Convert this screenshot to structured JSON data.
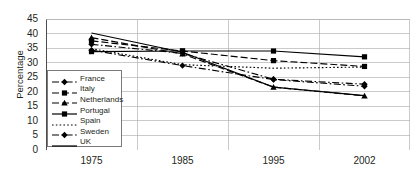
{
  "chart_data": {
    "type": "line",
    "title": "",
    "xlabel": "",
    "ylabel": "Percentage",
    "categories": [
      "1975",
      "1985",
      "1995",
      "2002"
    ],
    "x_tick_labels": [
      "1975",
      "1985",
      "1995",
      "2002"
    ],
    "y_tick_labels": [
      "0",
      "5",
      "10",
      "15",
      "20",
      "25",
      "30",
      "35",
      "40",
      "45"
    ],
    "ylim": [
      0,
      45
    ],
    "y_step": 5,
    "grid": "horizontal",
    "legend_position": "inside-lower-left",
    "series": [
      {
        "name": "France",
        "values": [
          36.3,
          33.2,
          24.3,
          22.6
        ],
        "marker": "diamond",
        "dash": "dash-dot",
        "color": "#000000"
      },
      {
        "name": "Italy",
        "values": [
          37.5,
          34.0,
          30.7,
          28.7
        ],
        "marker": "square",
        "dash": "dash",
        "color": "#000000"
      },
      {
        "name": "Netherlands",
        "values": [
          38.6,
          33.0,
          21.6,
          18.6
        ],
        "marker": "triangle",
        "dash": "dash",
        "color": "#000000"
      },
      {
        "name": "Portugal",
        "values": [
          33.8,
          34.0,
          34.0,
          32.0
        ],
        "marker": "square",
        "dash": "solid",
        "color": "#000000"
      },
      {
        "name": "Spain",
        "values": [
          34.8,
          29.3,
          28.1,
          28.5
        ],
        "marker": "none",
        "dash": "dotted",
        "color": "#000000"
      },
      {
        "name": "Sweden",
        "values": [
          34.3,
          29.0,
          24.2,
          21.9
        ],
        "marker": "diamond",
        "dash": "dash-dot",
        "color": "#000000"
      },
      {
        "name": "UK",
        "values": [
          40.2,
          33.6,
          21.6,
          18.7
        ],
        "marker": "none",
        "dash": "solid",
        "color": "#000000"
      }
    ]
  },
  "legend": {
    "entries": [
      {
        "label": "France"
      },
      {
        "label": "Italy"
      },
      {
        "label": "Netherlands"
      },
      {
        "label": "Portugal"
      },
      {
        "label": "Spain"
      },
      {
        "label": "Sweden"
      },
      {
        "label": "UK"
      }
    ]
  },
  "axes": {
    "y_title": "Percentage"
  }
}
